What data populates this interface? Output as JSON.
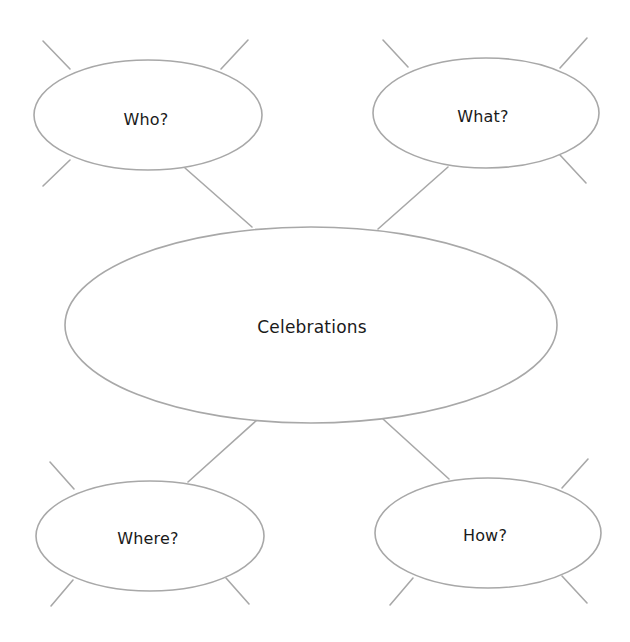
{
  "diagram": {
    "type": "mind-map",
    "center": {
      "label": "Celebrations"
    },
    "nodes": [
      {
        "id": "who",
        "label": "Who?"
      },
      {
        "id": "what",
        "label": "What?"
      },
      {
        "id": "where",
        "label": "Where?"
      },
      {
        "id": "how",
        "label": "How?"
      }
    ],
    "colors": {
      "stroke": "#a8a8a8",
      "text": "#1a1a1a",
      "background": "#ffffff"
    }
  }
}
